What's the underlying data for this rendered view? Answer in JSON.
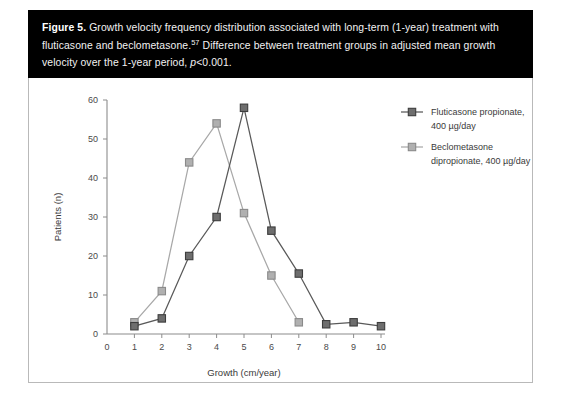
{
  "caption": {
    "figure_label": "Figure 5.",
    "line1": " Growth velocity frequency distribution associated with long-term (1-year) treatment with",
    "line2_a": "fluticasone and beclometasone.",
    "superscript": "57",
    "line2_b": " Difference between treatment groups in adjusted mean growth velocity",
    "line3_a": "over the 1-year period, ",
    "line3_italic": "p",
    "line3_b": "<0.001."
  },
  "chart_data": {
    "type": "line",
    "title": "",
    "xlabel": "Growth (cm/year)",
    "ylabel": "Patients (n)",
    "xlim": [
      0,
      10
    ],
    "ylim": [
      0,
      60
    ],
    "xticks": [
      "0",
      "1",
      "2",
      "3",
      "4",
      "5",
      "6",
      "7",
      "8",
      "9",
      "10"
    ],
    "yticks": [
      "0",
      "10",
      "20",
      "30",
      "40",
      "50",
      "60"
    ],
    "grid": false,
    "legend_position": "right",
    "x": [
      1,
      2,
      3,
      4,
      5,
      6,
      7,
      8,
      9,
      10
    ],
    "series": [
      {
        "name": "Fluticasone propionate, 400 µg/day",
        "legend_line1": "Fluticasone propionate,",
        "legend_line2": "400 µg/day",
        "color": "#6e6e6e",
        "line_color": "#595959",
        "x": [
          1,
          2,
          3,
          4,
          5,
          6,
          7,
          8,
          9,
          10
        ],
        "values": [
          2,
          4,
          20,
          30,
          58,
          26.5,
          15.5,
          2.5,
          3,
          2
        ]
      },
      {
        "name": "Beclometasone dipropionate, 400 µg/day",
        "legend_line1": "Beclometasone",
        "legend_line2": "dipropionate, 400 µg/day",
        "color": "#b0b0b0",
        "line_color": "#a8a8a8",
        "x": [
          1,
          2,
          3,
          4,
          5,
          6,
          7
        ],
        "values": [
          3,
          11,
          44,
          54,
          31,
          15,
          3
        ]
      }
    ]
  }
}
